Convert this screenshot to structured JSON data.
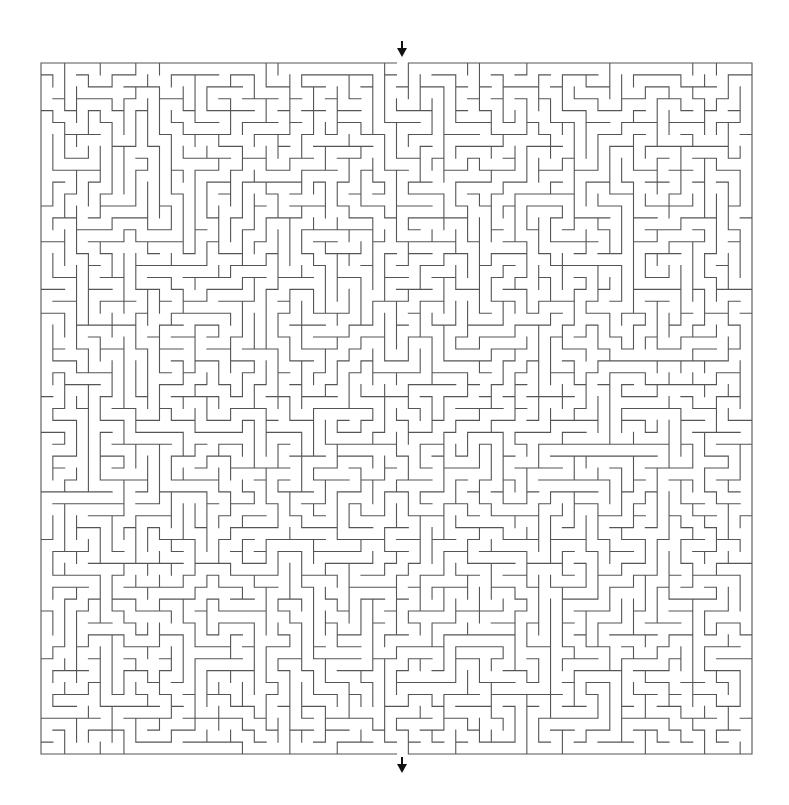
{
  "maze": {
    "cols": 60,
    "rows": 58,
    "origin_x": 41,
    "origin_y": 63,
    "width_px": 711,
    "height_px": 691,
    "entrance_col": 30,
    "exit_col": 30,
    "seed": 20240611,
    "wall_color": "#555555",
    "wall_width": 1.1,
    "background_color": "#ffffff"
  },
  "markers": {
    "entrance_arrow": {
      "x": 397,
      "y": 41,
      "direction": "down",
      "color": "#111111"
    },
    "exit_arrow": {
      "x": 397,
      "y": 757,
      "direction": "down",
      "color": "#111111"
    }
  }
}
